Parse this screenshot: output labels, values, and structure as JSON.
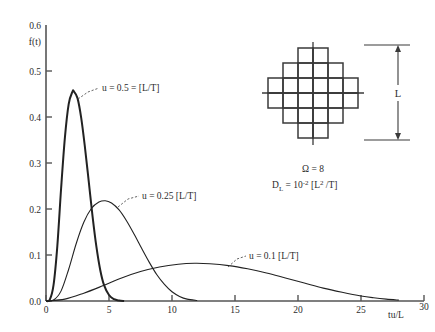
{
  "chart_data": {
    "type": "line",
    "title": "",
    "subtitle": "",
    "xlabel": "tu/L",
    "ylabel": "f(t)",
    "xlim": [
      0,
      30
    ],
    "ylim": [
      0,
      0.6
    ],
    "xticks": [
      "0",
      "5",
      "10",
      "15",
      "20",
      "25",
      "30"
    ],
    "xtick_values": [
      0,
      5,
      10,
      15,
      20,
      25,
      30
    ],
    "yticks": [
      "0.0",
      "0.1",
      "0.2",
      "0.3",
      "0.4",
      "0.5",
      "0.6"
    ],
    "ytick_values": [
      0.0,
      0.1,
      0.2,
      0.3,
      0.4,
      0.5,
      0.6
    ],
    "grid": false,
    "legend_position": "inline-annotations",
    "series": [
      {
        "name": "u = 0.5 = [L/T]",
        "annotation": "u = 0.5 = [L/T]",
        "peak_x": 2.2,
        "peak_y": 0.456,
        "x": [
          0.0,
          0.3,
          0.6,
          0.9,
          1.2,
          1.5,
          1.8,
          2.1,
          2.2,
          2.5,
          2.8,
          3.1,
          3.4,
          3.7,
          4.0,
          4.3,
          4.6,
          5.0,
          5.4,
          5.8,
          6.2
        ],
        "values": [
          0.0,
          0.003,
          0.035,
          0.12,
          0.245,
          0.355,
          0.428,
          0.455,
          0.456,
          0.441,
          0.397,
          0.332,
          0.258,
          0.183,
          0.118,
          0.068,
          0.035,
          0.013,
          0.004,
          0.001,
          0.0
        ]
      },
      {
        "name": "u = 0.25 [L/T]",
        "annotation": "u = 0.25 [L/T]",
        "peak_x": 4.7,
        "peak_y": 0.218,
        "x": [
          0.0,
          0.6,
          1.2,
          1.8,
          2.4,
          3.0,
          3.6,
          4.2,
          4.7,
          5.2,
          5.8,
          6.4,
          7.0,
          7.6,
          8.2,
          8.8,
          9.4,
          10.0,
          10.6,
          11.2,
          12.0
        ],
        "values": [
          0.0,
          0.002,
          0.022,
          0.069,
          0.125,
          0.171,
          0.201,
          0.215,
          0.218,
          0.213,
          0.198,
          0.174,
          0.145,
          0.114,
          0.084,
          0.057,
          0.036,
          0.02,
          0.01,
          0.004,
          0.001
        ]
      },
      {
        "name": "u = 0.1 [L/T]",
        "annotation": "u = 0.1 [L/T]",
        "peak_x": 11.8,
        "peak_y": 0.082,
        "x": [
          0.0,
          1.5,
          3.0,
          4.5,
          6.0,
          7.5,
          9.0,
          10.5,
          11.8,
          13.0,
          14.5,
          16.0,
          17.5,
          19.0,
          20.5,
          22.0,
          23.5,
          25.0,
          26.0,
          27.0,
          28.0
        ],
        "values": [
          0.0,
          0.004,
          0.017,
          0.033,
          0.05,
          0.064,
          0.074,
          0.08,
          0.082,
          0.081,
          0.077,
          0.07,
          0.061,
          0.05,
          0.039,
          0.028,
          0.019,
          0.011,
          0.007,
          0.004,
          0.002
        ]
      }
    ],
    "annotations": [
      {
        "text": "u = 0.5 = [L/T]",
        "at_x": 2.6,
        "at_y": 0.44
      },
      {
        "text": "u = 0.25 [L/T]",
        "at_x": 5.6,
        "at_y": 0.205
      },
      {
        "text": "u = 0.1 [L/T]",
        "at_x": 14.4,
        "at_y": 0.085
      }
    ]
  },
  "axes": {
    "y_axis_label": "f(t)",
    "y_top_label": "0.6",
    "x_axis_label": "tu/L",
    "x_end_label": "30"
  },
  "inset": {
    "dimension_label": "L",
    "omega_line": "Ω = 8",
    "diffusion_line_prefix": "D",
    "diffusion_line_sub": "L",
    "diffusion_line_body": " = 10",
    "diffusion_line_exp": "-2",
    "diffusion_line_tail": " [L",
    "diffusion_line_tail_exp": "2",
    "diffusion_line_end": " /T]",
    "omega_value": "8",
    "diffusion_full": "D_L = 10^-2 [L^2 /T]",
    "network_name": "diamond-lattice-network"
  },
  "colors": {
    "background": "#ffffff",
    "curve": "#222222",
    "axis": "#555555",
    "lattice": "#3a3a3a",
    "text": "#2b2b2b"
  }
}
